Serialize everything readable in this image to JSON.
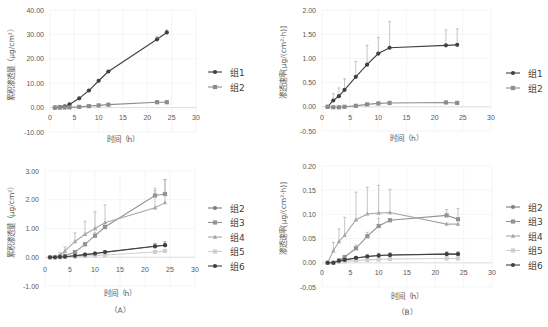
{
  "chart_data": [
    {
      "id": "A1",
      "type": "line",
      "title": "",
      "xlabel": "时间（h）",
      "ylabel": "累积渗透量（μg/cm²）",
      "xlim": [
        0,
        30
      ],
      "ylim": [
        -10,
        40
      ],
      "xticks": [
        0,
        5,
        10,
        15,
        20,
        25,
        30
      ],
      "yticks": [
        "-10.00",
        "0.00",
        "10.00",
        "20.00",
        "30.00",
        "40.00"
      ],
      "ytick_values": [
        -10,
        0,
        10,
        20,
        30,
        40
      ],
      "grid": true,
      "legend_position": "right",
      "x": [
        1,
        2,
        3,
        4,
        6,
        8,
        10,
        12,
        22,
        24
      ],
      "series": [
        {
          "name": "组1",
          "color": "#404040",
          "marker": "circle",
          "values": [
            0.0,
            0.2,
            0.5,
            1.3,
            3.8,
            7.0,
            11.0,
            14.8,
            28.0,
            30.8
          ],
          "err": [
            0,
            0,
            0,
            0,
            0,
            0,
            0,
            0,
            1.2,
            1.0
          ]
        },
        {
          "name": "组2",
          "color": "#8c8c8c",
          "marker": "square",
          "values": [
            0.0,
            0.0,
            0.05,
            0.1,
            0.3,
            0.6,
            0.9,
            1.2,
            2.2,
            2.2
          ],
          "err": [
            0,
            0,
            0,
            0,
            0,
            0,
            0,
            0,
            0,
            0
          ]
        }
      ]
    },
    {
      "id": "B1",
      "type": "line",
      "title": "",
      "xlabel": "时间（h）",
      "ylabel": "渗透速率[μg/(cm²·h)]",
      "xlim": [
        0,
        30
      ],
      "ylim": [
        -0.5,
        2.0
      ],
      "xticks": [
        0,
        5,
        10,
        15,
        20,
        25,
        30
      ],
      "yticks": [
        "-0.50",
        "0.00",
        "0.50",
        "1.00",
        "1.50",
        "2.00"
      ],
      "ytick_values": [
        -0.5,
        0,
        0.5,
        1.0,
        1.5,
        2.0
      ],
      "grid": true,
      "legend_position": "right",
      "x": [
        1,
        2,
        3,
        4,
        6,
        8,
        10,
        12,
        22,
        24
      ],
      "series": [
        {
          "name": "组1",
          "color": "#404040",
          "marker": "circle",
          "values": [
            0.0,
            0.13,
            0.22,
            0.35,
            0.62,
            0.87,
            1.1,
            1.22,
            1.27,
            1.28
          ],
          "err": [
            0,
            0.14,
            0.17,
            0.23,
            0.32,
            0.4,
            0.33,
            0.54,
            0.32,
            0.33
          ]
        },
        {
          "name": "组2",
          "color": "#8c8c8c",
          "marker": "square",
          "values": [
            0.0,
            -0.01,
            -0.01,
            0.0,
            0.02,
            0.05,
            0.07,
            0.08,
            0.09,
            0.08
          ],
          "err": [
            0,
            0,
            0,
            0,
            0,
            0,
            0,
            0,
            0,
            0
          ]
        }
      ]
    },
    {
      "id": "A2",
      "type": "line",
      "title": "",
      "caption": "（A）",
      "xlabel": "时间（h）",
      "ylabel": "累积渗透量（μg/cm²）",
      "xlim": [
        0,
        30
      ],
      "ylim": [
        -1,
        3
      ],
      "xticks": [
        0,
        5,
        10,
        15,
        20,
        25,
        30
      ],
      "yticks": [
        "-1.00",
        "0.00",
        "1.00",
        "2.00",
        "3.00"
      ],
      "ytick_values": [
        -1,
        0,
        1,
        2,
        3
      ],
      "grid": true,
      "legend_position": "right",
      "x": [
        1,
        2,
        3,
        4,
        6,
        8,
        10,
        12,
        22,
        24
      ],
      "series": [
        {
          "name": "组2",
          "color": "#7f7f7f",
          "marker": "circle",
          "values": [
            0.0,
            0.0,
            0.01,
            0.02,
            0.05,
            0.09,
            0.13,
            0.17,
            0.38,
            0.42
          ],
          "err": [
            0,
            0,
            0,
            0,
            0,
            0,
            0,
            0,
            0.1,
            0.12
          ]
        },
        {
          "name": "组3",
          "color": "#939393",
          "marker": "square",
          "values": [
            0.0,
            0.0,
            0.02,
            0.05,
            0.18,
            0.45,
            0.75,
            1.05,
            2.15,
            2.2
          ],
          "err": [
            0,
            0,
            0,
            0,
            0.05,
            0.05,
            0.12,
            0.0,
            0.25,
            0.5
          ]
        },
        {
          "name": "组4",
          "color": "#a6a6a6",
          "marker": "triangle",
          "values": [
            0.0,
            0.02,
            0.08,
            0.22,
            0.55,
            0.8,
            1.0,
            1.2,
            1.72,
            1.9
          ],
          "err": [
            0,
            0.02,
            0.08,
            0.14,
            0.3,
            0.45,
            0.58,
            0.62,
            0.6,
            0.8
          ]
        },
        {
          "name": "组5",
          "color": "#cfcfcf",
          "marker": "x",
          "values": [
            0.0,
            0.0,
            0.0,
            0.01,
            0.02,
            0.04,
            0.06,
            0.08,
            0.18,
            0.22
          ],
          "err": [
            0,
            0,
            0,
            0,
            0,
            0,
            0,
            0,
            0,
            0
          ]
        },
        {
          "name": "组6",
          "color": "#404040",
          "marker": "circle",
          "values": [
            0.0,
            0.0,
            0.01,
            0.02,
            0.05,
            0.09,
            0.13,
            0.18,
            0.38,
            0.42
          ],
          "err": [
            0,
            0,
            0,
            0,
            0,
            0,
            0,
            0.04,
            0.1,
            0.12
          ]
        }
      ]
    },
    {
      "id": "B2",
      "type": "line",
      "title": "",
      "caption": "（B）",
      "xlabel": "时间（h）",
      "ylabel": "渗透速率[μg/(cm²·h)]",
      "xlim": [
        0,
        30
      ],
      "ylim": [
        -0.05,
        0.2
      ],
      "xticks": [
        0,
        5,
        10,
        15,
        20,
        25,
        30
      ],
      "yticks": [
        "-0.05",
        "0.00",
        "0.05",
        "0.10",
        "0.15",
        "0.20"
      ],
      "ytick_values": [
        -0.05,
        0,
        0.05,
        0.1,
        0.15,
        0.2
      ],
      "grid": true,
      "legend_position": "right",
      "x": [
        1,
        2,
        3,
        4,
        6,
        8,
        10,
        12,
        22,
        24
      ],
      "series": [
        {
          "name": "组2",
          "color": "#7f7f7f",
          "marker": "circle",
          "values": [
            0.0,
            0.0,
            0.004,
            0.006,
            0.01,
            0.013,
            0.015,
            0.016,
            0.018,
            0.018
          ],
          "err": [
            0,
            0,
            0,
            0,
            0.003,
            0.004,
            0.005,
            0.005,
            0.005,
            0.005
          ]
        },
        {
          "name": "组3",
          "color": "#939393",
          "marker": "square",
          "values": [
            0.0,
            0.0,
            0.005,
            0.012,
            0.03,
            0.055,
            0.076,
            0.088,
            0.098,
            0.09
          ],
          "err": [
            0,
            0,
            0,
            0.003,
            0.007,
            0.008,
            0.016,
            0.0,
            0.012,
            0.022
          ]
        },
        {
          "name": "组4",
          "color": "#a6a6a6",
          "marker": "triangle",
          "values": [
            0.0,
            0.025,
            0.044,
            0.057,
            0.089,
            0.101,
            0.103,
            0.104,
            0.08,
            0.08
          ],
          "err": [
            0,
            0.017,
            0.026,
            0.037,
            0.057,
            0.055,
            0.057,
            0.048,
            0,
            0
          ]
        },
        {
          "name": "组5",
          "color": "#cfcfcf",
          "marker": "x",
          "values": [
            0.0,
            0.0,
            0.002,
            0.003,
            0.005,
            0.006,
            0.007,
            0.008,
            0.009,
            0.009
          ],
          "err": [
            0,
            0,
            0,
            0,
            0,
            0,
            0,
            0,
            0,
            0
          ]
        },
        {
          "name": "组6",
          "color": "#404040",
          "marker": "circle",
          "values": [
            0.0,
            0.0,
            0.004,
            0.006,
            0.01,
            0.013,
            0.015,
            0.016,
            0.018,
            0.018
          ],
          "err": [
            0,
            0,
            0,
            0,
            0.002,
            0.003,
            0.004,
            0.004,
            0.004,
            0.004
          ]
        }
      ]
    }
  ],
  "layout": [
    {
      "x0": 50,
      "x1": 196,
      "y_top": 10,
      "y_bot": 132,
      "legend_x": 208,
      "legend_y": 72,
      "legend_gap": 15,
      "xlabel_y": 142,
      "ylabel_x": 14,
      "tick_label_y": 120,
      "caption_y": null
    },
    {
      "x0": 322,
      "x1": 491,
      "y_top": 10,
      "y_bot": 131,
      "legend_x": 506,
      "legend_y": 73,
      "legend_gap": 15,
      "xlabel_y": 141,
      "ylabel_x": 286,
      "tick_label_y": 120,
      "caption_y": null
    },
    {
      "x0": 45,
      "x1": 195,
      "y_top": 171,
      "y_bot": 286,
      "legend_x": 208,
      "legend_y": 208,
      "legend_gap": 14.5,
      "xlabel_y": 296,
      "ylabel_x": 14,
      "tick_label_y": 272,
      "caption_y": 313
    },
    {
      "x0": 322,
      "x1": 492,
      "y_top": 166,
      "y_bot": 287,
      "legend_x": 506,
      "legend_y": 207,
      "legend_gap": 14.5,
      "xlabel_y": 299,
      "ylabel_x": 286,
      "tick_label_y": 275,
      "caption_y": 315
    }
  ]
}
